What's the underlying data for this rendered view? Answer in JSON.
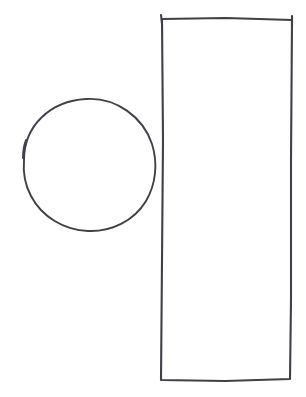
{
  "canvas": {
    "width": 306,
    "height": 397,
    "background_color": "#ffffff",
    "title": "Hand-drawn shapes sketch",
    "medium": "pen on white paper",
    "description": "A hand-drawn circle on the left and a tall narrow hand-drawn rectangle on the right"
  },
  "ink": {
    "stroke_color": "#3f4048",
    "circle_stroke_width": 1.9,
    "rect_stroke_width": 2.1
  },
  "shapes": [
    {
      "id": "circle",
      "label": "Hand-drawn circle",
      "kind": "circle",
      "center_x": 89,
      "center_y": 165,
      "radius_x": 67,
      "radius_y": 66,
      "bounds": {
        "left": 22,
        "top": 98,
        "right": 156,
        "bottom": 231
      },
      "path": "M 24 160 C 24 126, 50 101, 86 99 C 116 97, 143 117, 152 144 C 158 163, 156 184, 146 201 C 134 221, 111 232, 88 231 C 64 230, 42 217, 31 196 C 25 185, 23 172, 24 160 Z",
      "start_mark_path": "M 23 158 C 23 151, 24 145, 26 140",
      "notes": "Slightly irregular, flattened toward the upper right; pen start/stop overlap visible at upper left"
    },
    {
      "id": "rectangle",
      "label": "Hand-drawn tall rectangle",
      "kind": "rectangle",
      "bounds": {
        "left": 161,
        "top": 19,
        "right": 292,
        "bottom": 380
      },
      "width": 131,
      "height": 361,
      "corners": {
        "top_left": {
          "x": 162,
          "y": 19
        },
        "top_right": {
          "x": 292,
          "y": 20
        },
        "bottom_right": {
          "x": 290,
          "y": 379
        },
        "bottom_left": {
          "x": 161,
          "y": 380
        }
      },
      "path": "M 162 19 L 226 18 L 292 20 L 291 160 L 291 300 L 290 379 L 225 381 L 161 380 L 162 260 L 163 140 Z",
      "tick_top_left_path": "M 161 15 L 162 24",
      "tick_top_right_path": "M 292 16 L 292 25",
      "notes": "Edges are nearly straight with slight hand wobble; bottom edge dips a little at its middle; small pen ticks overshoot past the top corners"
    }
  ]
}
